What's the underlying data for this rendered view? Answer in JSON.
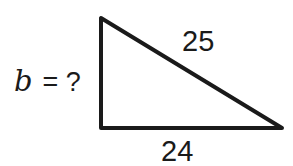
{
  "diagram": {
    "type": "right-triangle",
    "stroke_color": "#1a1a1a",
    "background": "#ffffff",
    "vertices": {
      "top": [
        101,
        18
      ],
      "right_angle": [
        101,
        128
      ],
      "right": [
        282,
        128
      ]
    },
    "sides": {
      "vertical_leg": {
        "label_var": "b",
        "label_eq": "= ?"
      },
      "hypotenuse": {
        "label": "25"
      },
      "horizontal_leg": {
        "label": "24"
      }
    }
  }
}
